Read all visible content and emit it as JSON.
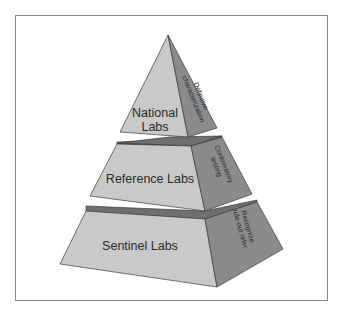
{
  "diagram": {
    "type": "pyramid",
    "colors": {
      "front_face": "#c9c9c9",
      "side_face": "#8b8b8b",
      "top_band": "#6f6f6f",
      "outline": "#3a3a3a",
      "frame": "#8a8a8a"
    },
    "tiers": [
      {
        "level": "top",
        "label_lines": [
          "National",
          "Labs"
        ],
        "side_label_lines": [
          "Definitive",
          "characterization"
        ]
      },
      {
        "level": "middle",
        "label_lines": [
          "Reference Labs"
        ],
        "side_label_lines": [
          "Confirmatory",
          "testing"
        ]
      },
      {
        "level": "bottom",
        "label_lines": [
          "Sentinel Labs"
        ],
        "side_label_lines": [
          "Recognize",
          "rule-out refer"
        ]
      }
    ]
  }
}
